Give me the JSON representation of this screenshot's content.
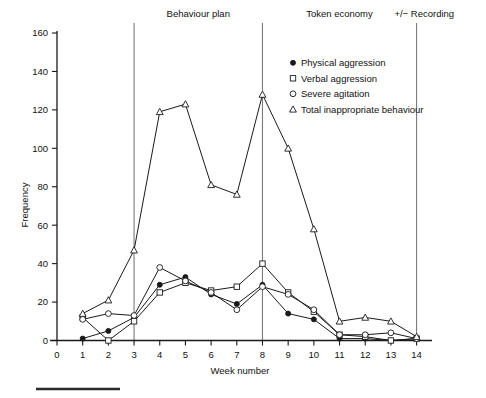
{
  "chart_data": {
    "type": "line",
    "title": "",
    "xlabel": "Week number",
    "ylabel": "Frequency",
    "xlim": [
      0,
      14.6
    ],
    "ylim": [
      0,
      160
    ],
    "xticks": [
      0,
      1,
      2,
      3,
      4,
      5,
      6,
      7,
      8,
      9,
      10,
      11,
      12,
      13,
      14
    ],
    "yticks": [
      0,
      20,
      40,
      60,
      80,
      100,
      120,
      140,
      160
    ],
    "grid": false,
    "legend_position": "upper-right-inside",
    "x": [
      1,
      2,
      3,
      4,
      5,
      6,
      7,
      8,
      9,
      10,
      11,
      12,
      13,
      14
    ],
    "series": [
      {
        "name": "Physical aggression",
        "marker": "filled-circle",
        "values": [
          1,
          5,
          12,
          29,
          33,
          24,
          19,
          29,
          14,
          11,
          1,
          1,
          0,
          1
        ]
      },
      {
        "name": "Verbal aggression",
        "marker": "open-square",
        "values": [
          12,
          0,
          10,
          25,
          30,
          26,
          28,
          40,
          25,
          15,
          3,
          2,
          0,
          1
        ]
      },
      {
        "name": "Severe agitation",
        "marker": "open-circle",
        "values": [
          11,
          14,
          13,
          38,
          31,
          25,
          16,
          28,
          24,
          16,
          3,
          3,
          4,
          1
        ]
      },
      {
        "name": "Total inappropriate behaviour",
        "marker": "open-triangle",
        "values": [
          14,
          21,
          47,
          119,
          123,
          81,
          76,
          128,
          100,
          58,
          10,
          12,
          10,
          2
        ]
      }
    ],
    "annotations": [
      {
        "label": "Behaviour plan",
        "phase_start_week": 3,
        "phase_end_week": 8
      },
      {
        "label": "Token economy",
        "phase_start_week": 8,
        "phase_end_week": 14
      },
      {
        "label": "+/− Recording",
        "phase_start_week": 14,
        "phase_end_week": 14.6
      }
    ],
    "phase_divider_weeks": [
      3,
      8,
      14
    ]
  },
  "axes": {
    "y_title": "Frequency",
    "x_title": "Week number",
    "y_tick_labels": [
      "0",
      "20",
      "40",
      "60",
      "80",
      "100",
      "120",
      "140",
      "160"
    ],
    "x_tick_labels": [
      "0",
      "1",
      "2",
      "3",
      "4",
      "5",
      "6",
      "7",
      "8",
      "9",
      "10",
      "11",
      "12",
      "13",
      "14"
    ]
  },
  "legend": {
    "items": [
      {
        "label": "Physical aggression",
        "marker": "filled-circle"
      },
      {
        "label": "Verbal aggression",
        "marker": "open-square"
      },
      {
        "label": "Severe agitation",
        "marker": "open-circle"
      },
      {
        "label": "Total inappropriate behaviour",
        "marker": "open-triangle"
      }
    ]
  },
  "phases": {
    "behaviour_plan": "Behaviour plan",
    "token_economy": "Token economy",
    "recording": "+/− Recording"
  },
  "colors": {
    "ink": "#1a1a1a",
    "phase_line": "#7a7a7a",
    "background": "#ffffff",
    "footer_rule": "#2b2b2b"
  }
}
